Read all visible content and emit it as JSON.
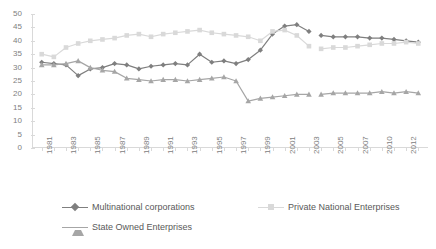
{
  "chart_data": {
    "type": "line",
    "title": "",
    "xlabel": "",
    "ylabel": "",
    "ylim": [
      0,
      50
    ],
    "ytick_step": 5,
    "grid": false,
    "legend_position": "bottom",
    "yticks": [
      "0",
      "5",
      "10",
      "15",
      "20",
      "25",
      "30",
      "35",
      "40",
      "45",
      "50"
    ],
    "x": [
      1981,
      1982,
      1983,
      1984,
      1985,
      1986,
      1987,
      1988,
      1989,
      1990,
      1991,
      1992,
      1993,
      1994,
      1995,
      1996,
      1997,
      1998,
      1999,
      2000,
      2001,
      2002,
      2003,
      2005,
      2006,
      2007,
      2008,
      2009,
      2010,
      2011,
      2012,
      2013
    ],
    "xtick_labels": [
      "1981",
      "",
      "1983",
      "",
      "1985",
      "",
      "1987",
      "",
      "1989",
      "",
      "1991",
      "",
      "1993",
      "",
      "1995",
      "",
      "1997",
      "",
      "1999",
      "",
      "2001",
      "",
      "2003",
      "",
      "2005",
      "",
      "2007",
      "",
      "2010",
      "",
      "2012",
      ""
    ],
    "gap_after_x": 2003,
    "gap_before_x": 2005,
    "series": [
      {
        "name": "Multinational corporations",
        "color": "#7f7f7f",
        "marker": "diamond",
        "values": [
          32.0,
          31.5,
          31.0,
          27.0,
          29.5,
          30.0,
          31.5,
          31.0,
          29.5,
          30.5,
          31.0,
          31.5,
          31.0,
          35.0,
          32.0,
          32.5,
          31.5,
          33.0,
          36.5,
          42.5,
          45.5,
          46.0,
          43.5,
          42.0,
          41.5,
          41.5,
          41.5,
          41.0,
          41.0,
          40.5,
          40.0,
          39.5
        ]
      },
      {
        "name": "Private National Enterprises",
        "color": "#d9d9d9",
        "marker": "square",
        "values": [
          35.0,
          34.0,
          37.5,
          39.0,
          40.0,
          40.5,
          41.0,
          42.0,
          42.5,
          41.5,
          42.5,
          43.0,
          43.5,
          44.0,
          43.0,
          42.5,
          42.0,
          41.5,
          40.0,
          43.5,
          44.0,
          42.0,
          38.0,
          37.0,
          37.5,
          37.5,
          38.0,
          38.5,
          39.0,
          39.0,
          39.5,
          39.0
        ]
      },
      {
        "name": "State Owned Enterprises",
        "color": "#a6a6a6",
        "marker": "triangle",
        "values": [
          31.0,
          31.0,
          31.5,
          32.5,
          30.0,
          29.0,
          28.5,
          26.0,
          25.5,
          25.0,
          25.5,
          25.5,
          25.0,
          25.5,
          26.0,
          26.5,
          25.0,
          17.5,
          18.5,
          19.0,
          19.5,
          20.0,
          20.0,
          20.0,
          20.5,
          20.5,
          20.5,
          20.5,
          21.0,
          20.5,
          21.0,
          20.5
        ]
      }
    ]
  },
  "legend": {
    "items": [
      {
        "label": "Multinational corporations",
        "color": "#7f7f7f",
        "marker": "diamond"
      },
      {
        "label": "Private National Enterprises",
        "color": "#d9d9d9",
        "marker": "square"
      },
      {
        "label": "State Owned Enterprises",
        "color": "#a6a6a6",
        "marker": "triangle"
      }
    ]
  }
}
